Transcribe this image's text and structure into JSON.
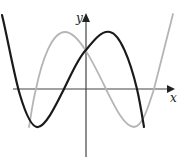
{
  "diagram": {
    "type": "function-graph",
    "axes": {
      "x_label": "x",
      "y_label": "y",
      "axis_color": "#444444"
    },
    "curves": [
      {
        "name": "black-curve",
        "color": "#1a1a1a",
        "width": 2.2,
        "path": "M2,15 C8,40 14,75 20,95 C26,115 32,128 38,127 C46,126 56,105 64,89 C72,73 78,58 86,50 C94,40 102,30 110,32 C120,34 130,60 137,89 C140,102 142,115 144,127"
      },
      {
        "name": "gray-curve",
        "color": "#b5b5b5",
        "width": 1.8,
        "path": "M29,127 C31,115 33,100 36,89 C42,60 52,32 65,32 C78,32 92,60 106,89 C114,105 124,127 134,127 C142,127 148,108 154,89 C160,65 167,38 173,14"
      }
    ]
  }
}
